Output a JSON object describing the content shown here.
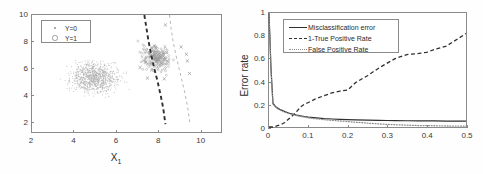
{
  "figure": {
    "background": "#ffffff",
    "axis_color": "#8a8a8a",
    "text_color": "#2b2b2b"
  },
  "chart_data": [
    {
      "id": "scatter-decision-boundary",
      "type": "scatter",
      "title": "",
      "xlabel": "X",
      "xlabel_sub": "1",
      "ylabel": "",
      "xlim": [
        2,
        11
      ],
      "ylim": [
        1.2,
        10
      ],
      "xticks": [
        "2",
        "4",
        "6",
        "8",
        "10"
      ],
      "xtick_values": [
        2,
        4,
        6,
        8,
        10
      ],
      "yticks": [
        "2",
        "4",
        "6",
        "8",
        "10"
      ],
      "ytick_values": [
        2,
        4,
        6,
        8,
        10
      ],
      "grid": false,
      "legend_position": "top-left",
      "legend": [
        {
          "label": "Y=0",
          "marker": "dot",
          "color": "#9a9a9a"
        },
        {
          "label": "Y=1",
          "marker": "circle",
          "color": "#9a9a9a"
        }
      ],
      "series": [
        {
          "name": "Y=0",
          "marker": "dot",
          "color": "#b0b0b0",
          "center": [
            5.0,
            5.3
          ],
          "spread": [
            0.95,
            0.9
          ],
          "count": 900
        },
        {
          "name": "Y=1",
          "marker": "circle-x",
          "color": "#9a9a9a",
          "center": [
            7.9,
            6.8
          ],
          "spread": [
            0.55,
            0.75
          ],
          "count": 190
        }
      ],
      "annotations": [
        {
          "name": "bold-decision-boundary",
          "style": "dashed-bold",
          "color": "#2f2f2f",
          "points": [
            [
              7.35,
              10.0
            ],
            [
              7.45,
              9.0
            ],
            [
              7.55,
              8.0
            ],
            [
              7.68,
              7.0
            ],
            [
              7.82,
              6.0
            ],
            [
              7.98,
              5.0
            ],
            [
              8.12,
              4.0
            ],
            [
              8.25,
              3.0
            ],
            [
              8.35,
              1.8
            ]
          ]
        },
        {
          "name": "light-decision-boundary",
          "style": "dashed-light",
          "color": "#b5b5b5",
          "points": [
            [
              8.55,
              10.0
            ],
            [
              8.62,
              9.0
            ],
            [
              8.72,
              8.0
            ],
            [
              8.85,
              7.0
            ],
            [
              9.0,
              6.0
            ],
            [
              9.15,
              5.0
            ],
            [
              9.3,
              4.0
            ],
            [
              9.42,
              3.0
            ],
            [
              9.52,
              1.8
            ]
          ]
        }
      ]
    },
    {
      "id": "error-rate-vs-threshold",
      "type": "line",
      "title": "",
      "xlabel": "Threshold (r)",
      "ylabel": "Error rate",
      "xlim": [
        0,
        0.5
      ],
      "ylim": [
        0,
        1
      ],
      "xticks": [
        "0",
        "0.1",
        "0.2",
        "0.3",
        "0.4",
        "0.5"
      ],
      "xtick_values": [
        0,
        0.1,
        0.2,
        0.3,
        0.4,
        0.5
      ],
      "yticks": [
        "0",
        "0.2",
        "0.4",
        "0.6",
        "0.8",
        "1"
      ],
      "ytick_values": [
        0,
        0.2,
        0.4,
        0.6,
        0.8,
        1
      ],
      "grid": false,
      "legend_position": "top-left",
      "legend": [
        {
          "label": "Misclassification error",
          "style": "solid",
          "color": "#2f2f2f"
        },
        {
          "label": "1-True Positive Rate",
          "style": "dashed",
          "color": "#2f2f2f"
        },
        {
          "label": "False Positive Rate",
          "style": "dotted",
          "color": "#8f8f8f"
        }
      ],
      "x": [
        0,
        0.005,
        0.01,
        0.015,
        0.02,
        0.03,
        0.04,
        0.05,
        0.06,
        0.07,
        0.08,
        0.09,
        0.1,
        0.12,
        0.14,
        0.16,
        0.18,
        0.2,
        0.22,
        0.25,
        0.28,
        0.3,
        0.32,
        0.35,
        0.38,
        0.4,
        0.42,
        0.45,
        0.48,
        0.5
      ],
      "series": [
        {
          "name": "Misclassification error",
          "style": "solid",
          "color": "#2f2f2f",
          "values": [
            1.0,
            0.52,
            0.21,
            0.185,
            0.17,
            0.15,
            0.135,
            0.123,
            0.113,
            0.105,
            0.098,
            0.092,
            0.087,
            0.08,
            0.074,
            0.07,
            0.067,
            0.064,
            0.062,
            0.06,
            0.058,
            0.057,
            0.056,
            0.055,
            0.054,
            0.053,
            0.053,
            0.052,
            0.052,
            0.051
          ]
        },
        {
          "name": "1-True Positive Rate",
          "style": "dashed",
          "color": "#2f2f2f",
          "values": [
            0.0,
            0.0,
            0.0,
            0.005,
            0.01,
            0.02,
            0.04,
            0.07,
            0.1,
            0.135,
            0.175,
            0.2,
            0.215,
            0.25,
            0.275,
            0.3,
            0.315,
            0.325,
            0.39,
            0.45,
            0.52,
            0.56,
            0.6,
            0.635,
            0.645,
            0.655,
            0.68,
            0.71,
            0.775,
            0.82
          ]
        },
        {
          "name": "False Positive Rate",
          "style": "dotted",
          "color": "#8f8f8f",
          "values": [
            1.0,
            0.5,
            0.2,
            0.18,
            0.165,
            0.145,
            0.13,
            0.118,
            0.108,
            0.1,
            0.092,
            0.086,
            0.08,
            0.072,
            0.064,
            0.058,
            0.053,
            0.048,
            0.042,
            0.034,
            0.027,
            0.023,
            0.02,
            0.016,
            0.013,
            0.012,
            0.011,
            0.009,
            0.008,
            0.007
          ]
        }
      ]
    }
  ]
}
